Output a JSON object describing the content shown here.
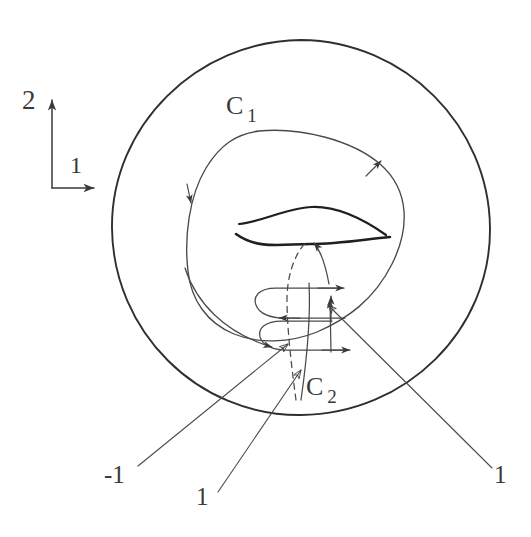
{
  "figure": {
    "kind": "hand-drawn-topology-diagram",
    "background_color": "#ffffff",
    "stroke_color": "#3a3a3a",
    "width": 531,
    "height": 537,
    "axes": {
      "vertical_label": "2",
      "horizontal_label": "1",
      "corner": [
        52,
        188
      ]
    },
    "curves": {
      "outer_boundary": {
        "name": "outer-circle",
        "center": [
          301,
          228
        ],
        "radius": 188
      },
      "loop_c1": {
        "label": "C",
        "subscript": "1"
      },
      "coil_c2": {
        "label": "C",
        "subscript": "2"
      }
    },
    "annotations": [
      {
        "name": "label-minus-one",
        "text": "-1",
        "at": [
          104,
          462
        ],
        "leader_to": [
          286,
          345
        ]
      },
      {
        "name": "label-one-bottom",
        "text": "1",
        "at": [
          196,
          484
        ],
        "leader_to": [
          300,
          368
        ]
      },
      {
        "name": "label-one-right",
        "text": "1",
        "at": [
          494,
          462
        ],
        "leader_to": [
          326,
          303
        ]
      }
    ]
  }
}
